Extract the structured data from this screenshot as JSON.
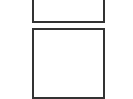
{
  "diagram": {
    "boxes": [
      {
        "id": "top-box",
        "label": ""
      },
      {
        "id": "bottom-box",
        "label": ""
      }
    ],
    "colors": {
      "border": "#333333",
      "background": "#ffffff"
    }
  }
}
